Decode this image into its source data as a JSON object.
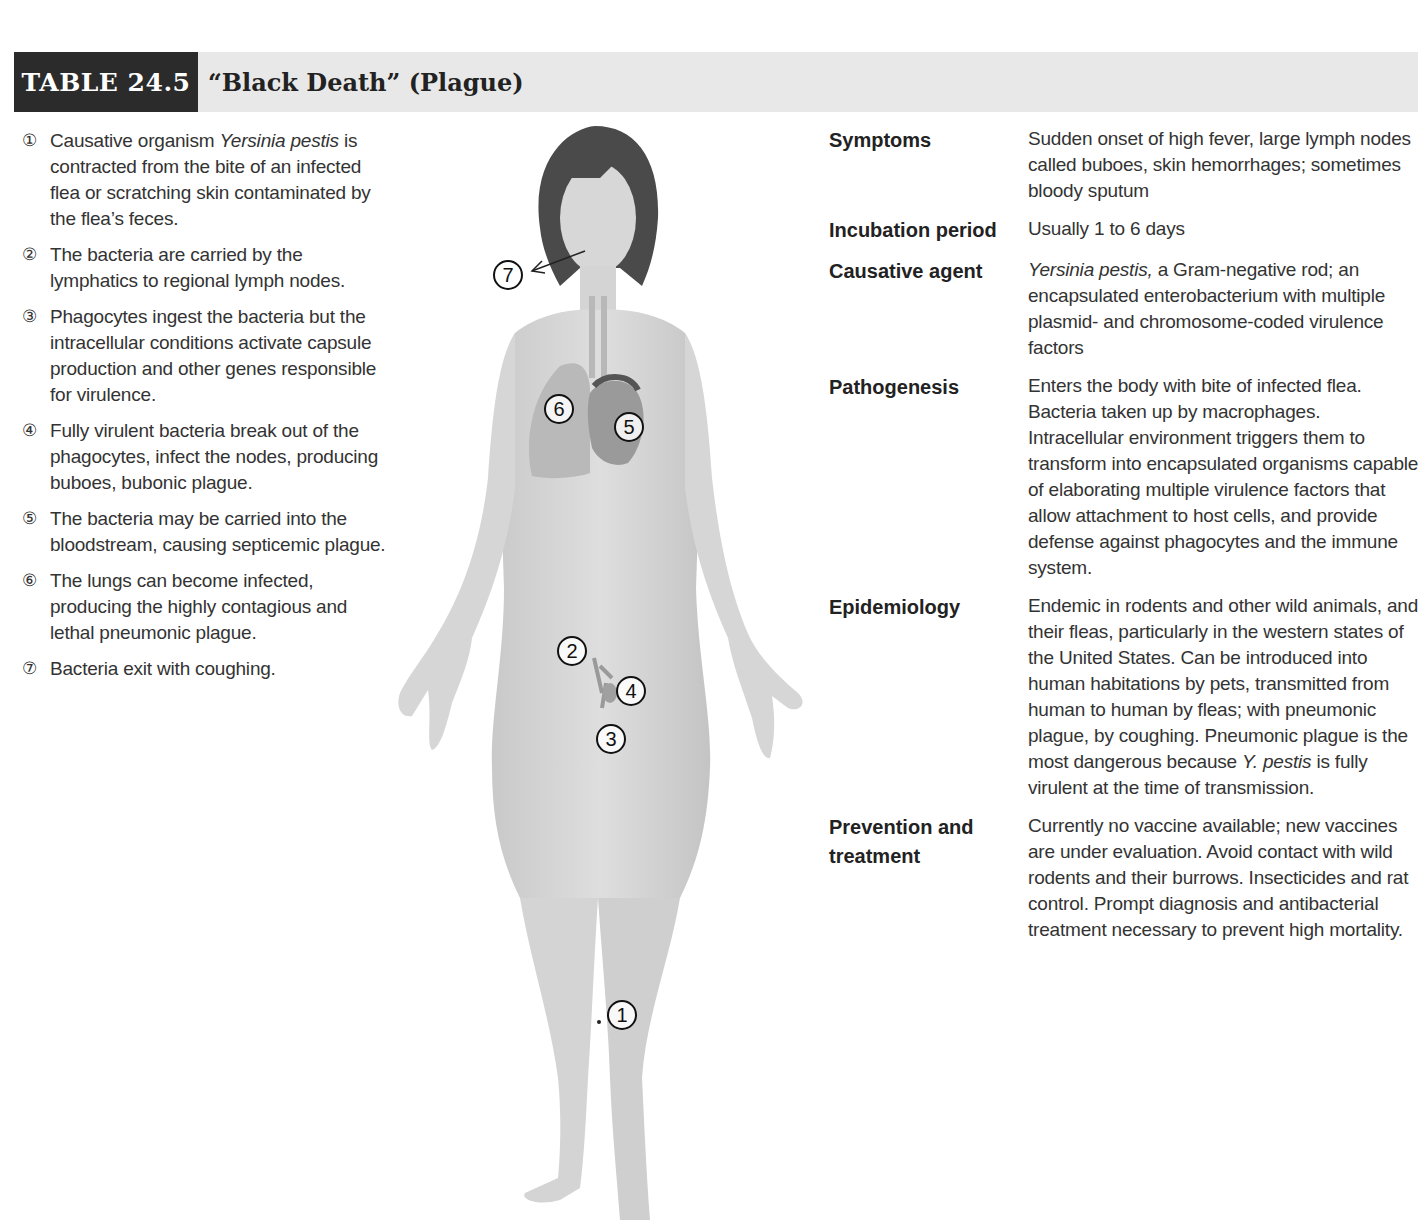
{
  "header": {
    "table_number": "TABLE 24.5",
    "title": "“Black Death” (Plague)",
    "colors": {
      "tag_background": "#2b2b2b",
      "band_background": "#e8e8e8"
    }
  },
  "steps": [
    {
      "marker": "①",
      "text_before": "Causative organism ",
      "italic": "Yersinia pestis",
      "text_after": " is contracted from the bite of an infected flea or scratching skin contaminated by the flea’s feces."
    },
    {
      "marker": "②",
      "text_before": "The bacteria are carried by the lymphatics to regional lymph nodes.",
      "italic": "",
      "text_after": ""
    },
    {
      "marker": "③",
      "text_before": "Phagocytes ingest the bacteria but the intracellular conditions activate capsule production and other genes responsible for virulence.",
      "italic": "",
      "text_after": ""
    },
    {
      "marker": "④",
      "text_before": "Fully virulent bacteria break out of the phagocytes, infect the nodes, producing buboes, bubonic plague.",
      "italic": "",
      "text_after": ""
    },
    {
      "marker": "⑤",
      "text_before": "The bacteria may be carried into the bloodstream, causing septicemic plague.",
      "italic": "",
      "text_after": ""
    },
    {
      "marker": "⑥",
      "text_before": "The lungs can become infected, producing the highly contagious and lethal pneumonic plague.",
      "italic": "",
      "text_after": ""
    },
    {
      "marker": "⑦",
      "text_before": "Bacteria exit with coughing.",
      "italic": "",
      "text_after": ""
    }
  ],
  "figure": {
    "callouts": [
      "1",
      "2",
      "3",
      "4",
      "5",
      "6",
      "7"
    ]
  },
  "rows": [
    {
      "term": "Symptoms",
      "desc_before": "",
      "italic": "",
      "desc_after": "Sudden onset of high fever, large lymph nodes called buboes, skin hemorrhages; sometimes bloody sputum"
    },
    {
      "term": "Incubation period",
      "desc_before": "",
      "italic": "",
      "desc_after": "Usually 1 to 6 days"
    },
    {
      "term": "Causative agent",
      "desc_before": "",
      "italic": "Yersinia pestis,",
      "desc_after": " a Gram-negative rod; an encapsulated enterobacterium with multiple plasmid- and chromosome-coded virulence factors"
    },
    {
      "term": "Pathogenesis",
      "desc_before": "",
      "italic": "",
      "desc_after": "Enters the body with bite of infected flea. Bacteria taken up by macrophages. Intracellular environment triggers them to transform into encapsulated organisms capable of elaborating multiple virulence factors that allow attachment to host cells, and provide defense against phagocytes and the immune system."
    },
    {
      "term": "Epidemiology",
      "desc_before": "Endemic in rodents and other wild animals, and their fleas, particularly in the western states of the United States. Can be introduced into human habitations by pets, transmitted from human to human by fleas; with pneumonic plague, by coughing. Pneumonic plague is the most dangerous because ",
      "italic": "Y. pestis",
      "desc_after": " is fully virulent at the time of transmission."
    },
    {
      "term": "Prevention and treatment",
      "desc_before": "",
      "italic": "",
      "desc_after": "Currently no vaccine available; new vaccines are under evaluation. Avoid contact with wild rodents and their burrows. Insecticides and rat control. Prompt diagnosis and antibacterial treatment necessary to prevent high mortality."
    }
  ]
}
